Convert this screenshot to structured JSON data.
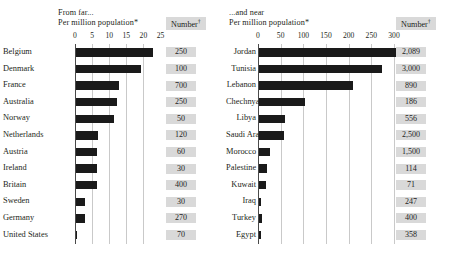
{
  "chart_data": [
    {
      "type": "bar",
      "title": "From far...",
      "subtitle": "Per million population*",
      "number_column_header": "Number",
      "xlabel": "",
      "ylabel": "",
      "orientation": "horizontal",
      "xlim": [
        0,
        27
      ],
      "ticks": [
        0,
        5,
        10,
        15,
        20,
        25
      ],
      "grid": true,
      "categories": [
        "Belgium",
        "Denmark",
        "France",
        "Australia",
        "Norway",
        "Netherlands",
        "Austria",
        "Ireland",
        "Britain",
        "Sweden",
        "Germany",
        "United States"
      ],
      "values": [
        22.5,
        19.0,
        12.5,
        12.0,
        11.0,
        6.5,
        6.2,
        6.2,
        6.0,
        2.5,
        2.5,
        0.2
      ],
      "numbers": [
        "250",
        "100",
        "700",
        "250",
        "50",
        "120",
        "60",
        "30",
        "400",
        "30",
        "270",
        "70"
      ]
    },
    {
      "type": "bar",
      "title": "...and near",
      "subtitle": "Per million population*",
      "number_column_header": "Number",
      "xlabel": "",
      "ylabel": "",
      "orientation": "horizontal",
      "xlim": [
        0,
        330
      ],
      "ticks": [
        0,
        50,
        100,
        150,
        200,
        250,
        300
      ],
      "grid": true,
      "categories": [
        "Jordan",
        "Tunisia",
        "Lebanon",
        "Chechnya",
        "Libya",
        "Saudi Arabia",
        "Morocco",
        "Palestine",
        "Kuwait",
        "Iraq",
        "Turkey",
        "Egypt"
      ],
      "values": [
        317,
        272,
        207,
        101,
        58,
        55,
        25,
        17,
        16,
        5,
        6,
        4
      ],
      "numbers": [
        "2,089",
        "3,000",
        "890",
        "186",
        "556",
        "2,500",
        "1,500",
        "114",
        "71",
        "247",
        "400",
        "358"
      ]
    }
  ],
  "left": {
    "header_line1": "From far...",
    "header_line2": "Per million population*",
    "number_header": "Number",
    "ticks": [
      "0",
      "5",
      "10",
      "15",
      "20",
      "25"
    ],
    "rows": [
      {
        "label": "Belgium",
        "number": "250"
      },
      {
        "label": "Denmark",
        "number": "100"
      },
      {
        "label": "France",
        "number": "700"
      },
      {
        "label": "Australia",
        "number": "250"
      },
      {
        "label": "Norway",
        "number": "50"
      },
      {
        "label": "Netherlands",
        "number": "120"
      },
      {
        "label": "Austria",
        "number": "60"
      },
      {
        "label": "Ireland",
        "number": "30"
      },
      {
        "label": "Britain",
        "number": "400"
      },
      {
        "label": "Sweden",
        "number": "30"
      },
      {
        "label": "Germany",
        "number": "270"
      },
      {
        "label": "United States",
        "number": "70"
      }
    ]
  },
  "right": {
    "header_line1": "...and near",
    "header_line2": "Per million population*",
    "number_header": "Number",
    "ticks": [
      "0",
      "50",
      "100",
      "150",
      "200",
      "250",
      "300"
    ],
    "rows": [
      {
        "label": "Jordan",
        "number": "2,089"
      },
      {
        "label": "Tunisia",
        "number": "3,000"
      },
      {
        "label": "Lebanon",
        "number": "890"
      },
      {
        "label": "Chechnya",
        "number": "186"
      },
      {
        "label": "Libya",
        "number": "556"
      },
      {
        "label": "Saudi Arabia",
        "number": "2,500"
      },
      {
        "label": "Morocco",
        "number": "1,500"
      },
      {
        "label": "Palestine",
        "number": "114"
      },
      {
        "label": "Kuwait",
        "number": "71"
      },
      {
        "label": "Iraq",
        "number": "247"
      },
      {
        "label": "Turkey",
        "number": "400"
      },
      {
        "label": "Egypt",
        "number": "358"
      }
    ]
  },
  "colors": {
    "bar": "#1a1a1a",
    "grid": "#c9c9c9",
    "number_bg": "#d9d9d9",
    "text": "#231f20"
  }
}
